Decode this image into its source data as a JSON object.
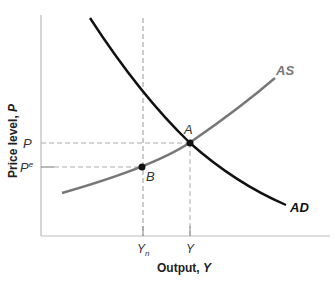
{
  "diagram": {
    "type": "AS-AD model",
    "y_axis_label": "Price level, ",
    "y_axis_var": "P",
    "x_axis_label": "Output, ",
    "x_axis_var": "Y",
    "y_ticks": [
      {
        "label": "P",
        "sup": ""
      },
      {
        "label": "P",
        "sup": "e"
      }
    ],
    "x_ticks": [
      {
        "label": "Y",
        "sub": "n"
      },
      {
        "label": "Y",
        "sub": ""
      }
    ],
    "curves": [
      {
        "name": "AS",
        "label": "AS",
        "color": "#777777"
      },
      {
        "name": "AD",
        "label": "AD",
        "color": "#111111"
      }
    ],
    "points": [
      {
        "name": "A",
        "label": "A"
      },
      {
        "name": "B",
        "label": "B"
      }
    ],
    "colors": {
      "axis": "#bbbbbb",
      "guide": "#aaaaaa",
      "text": "#333333"
    }
  }
}
